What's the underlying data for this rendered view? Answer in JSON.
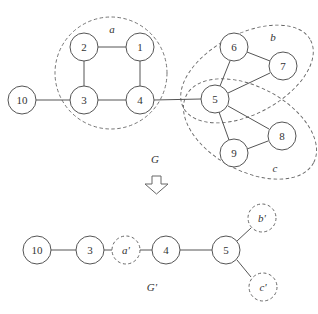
{
  "top_graph": {
    "label": "G",
    "nodes": [
      {
        "id": "1",
        "label": "1"
      },
      {
        "id": "2",
        "label": "2"
      },
      {
        "id": "3",
        "label": "3"
      },
      {
        "id": "4",
        "label": "4"
      },
      {
        "id": "5",
        "label": "5"
      },
      {
        "id": "6",
        "label": "6"
      },
      {
        "id": "7",
        "label": "7"
      },
      {
        "id": "8",
        "label": "8"
      },
      {
        "id": "9",
        "label": "9"
      },
      {
        "id": "10",
        "label": "10"
      }
    ],
    "edges": [
      [
        "10",
        "3"
      ],
      [
        "3",
        "2"
      ],
      [
        "2",
        "1"
      ],
      [
        "1",
        "4"
      ],
      [
        "3",
        "4"
      ],
      [
        "4",
        "5"
      ],
      [
        "5",
        "6"
      ],
      [
        "6",
        "7"
      ],
      [
        "5",
        "7"
      ],
      [
        "5",
        "8"
      ],
      [
        "5",
        "9"
      ],
      [
        "9",
        "8"
      ]
    ],
    "groups": [
      {
        "id": "a",
        "label": "a",
        "members": [
          "1",
          "2",
          "3",
          "4"
        ]
      },
      {
        "id": "b",
        "label": "b",
        "members": [
          "5",
          "6",
          "7"
        ]
      },
      {
        "id": "c",
        "label": "c",
        "members": [
          "5",
          "8",
          "9"
        ]
      }
    ]
  },
  "transform_arrow": {
    "icon": "down-arrow-icon"
  },
  "bottom_graph": {
    "label": "G'",
    "nodes": [
      {
        "id": "10",
        "label": "10",
        "style": "solid"
      },
      {
        "id": "3",
        "label": "3",
        "style": "solid"
      },
      {
        "id": "a'",
        "label": "a'",
        "style": "dashed"
      },
      {
        "id": "4",
        "label": "4",
        "style": "solid"
      },
      {
        "id": "5",
        "label": "5",
        "style": "solid"
      },
      {
        "id": "b'",
        "label": "b'",
        "style": "dashed"
      },
      {
        "id": "c'",
        "label": "c'",
        "style": "dashed"
      }
    ],
    "edges": [
      [
        "10",
        "3"
      ],
      [
        "3",
        "a'"
      ],
      [
        "a'",
        "4"
      ],
      [
        "4",
        "5"
      ],
      [
        "5",
        "b'"
      ],
      [
        "5",
        "c'"
      ]
    ]
  }
}
